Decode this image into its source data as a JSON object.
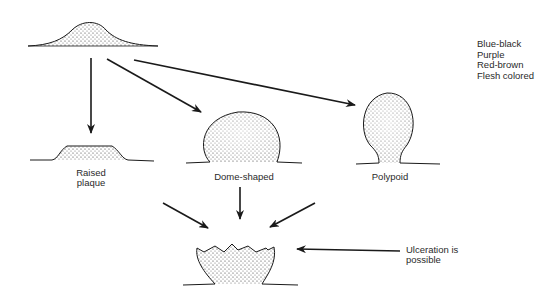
{
  "diagram": {
    "color_legend": [
      "Blue-black",
      "Purple",
      "Red-brown",
      "Flesh colored"
    ],
    "stages": [
      {
        "id": "initial",
        "label": ""
      },
      {
        "id": "raised-plaque",
        "label_line1": "Raised",
        "label_line2": "plaque"
      },
      {
        "id": "dome-shaped",
        "label": "Dome-shaped"
      },
      {
        "id": "polypoid",
        "label": "Polypoid"
      },
      {
        "id": "ulcerated",
        "label_line1": "Ulceration is",
        "label_line2": "possible"
      }
    ],
    "colors": {
      "ink": "#1a1a1a",
      "stipple": "#3a3a3a",
      "background": "#ffffff"
    }
  }
}
